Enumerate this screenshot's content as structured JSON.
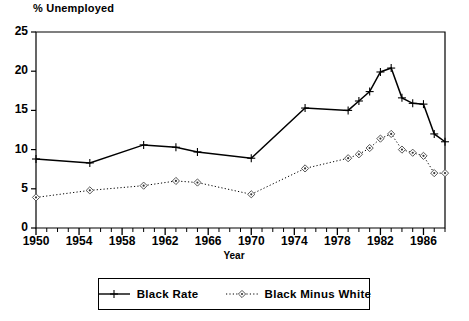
{
  "chart": {
    "title": "% Unemployed",
    "xlabel": "Year"
  },
  "legend": {
    "items": [
      {
        "label": "Black Rate",
        "style": "solid",
        "marker": "cross",
        "color": "#000000"
      },
      {
        "label": "Black Minus White",
        "style": "dotted",
        "marker": "diamond",
        "color": "#000000"
      }
    ]
  },
  "chart_data": {
    "type": "line",
    "title": "% Unemployed",
    "xlabel": "Year",
    "ylabel": "",
    "xlim": [
      1950,
      1988
    ],
    "ylim": [
      0,
      25
    ],
    "yticks": [
      0,
      5,
      10,
      15,
      20,
      25
    ],
    "xticks": [
      1950,
      1954,
      1958,
      1962,
      1966,
      1970,
      1974,
      1978,
      1982,
      1986
    ],
    "xticks_minor_step": 1,
    "grid": false,
    "legend_position": "below",
    "series": [
      {
        "name": "Black Rate",
        "style": "solid",
        "marker": "cross",
        "x": [
          1950,
          1955,
          1960,
          1963,
          1965,
          1970,
          1975,
          1979,
          1980,
          1981,
          1982,
          1983,
          1984,
          1985,
          1986,
          1987,
          1988
        ],
        "y": [
          8.8,
          8.3,
          10.6,
          10.3,
          9.7,
          8.9,
          15.3,
          15.0,
          16.2,
          17.4,
          19.9,
          20.4,
          16.6,
          15.9,
          15.8,
          12.0,
          11.0
        ]
      },
      {
        "name": "Black Minus White",
        "style": "dotted",
        "marker": "diamond",
        "x": [
          1950,
          1955,
          1960,
          1963,
          1965,
          1970,
          1975,
          1979,
          1980,
          1981,
          1982,
          1983,
          1984,
          1985,
          1986,
          1987,
          1988
        ],
        "y": [
          3.9,
          4.8,
          5.4,
          6.0,
          5.8,
          4.3,
          7.6,
          8.9,
          9.4,
          10.2,
          11.4,
          12.0,
          10.0,
          9.6,
          9.2,
          7.0,
          7.0
        ]
      }
    ]
  },
  "ytick_labels": [
    "0",
    "5",
    "10",
    "15",
    "20",
    "25"
  ],
  "xtick_labels": [
    "1950",
    "1954",
    "1958",
    "1962",
    "1966",
    "1970",
    "1974",
    "1978",
    "1982",
    "1986"
  ]
}
